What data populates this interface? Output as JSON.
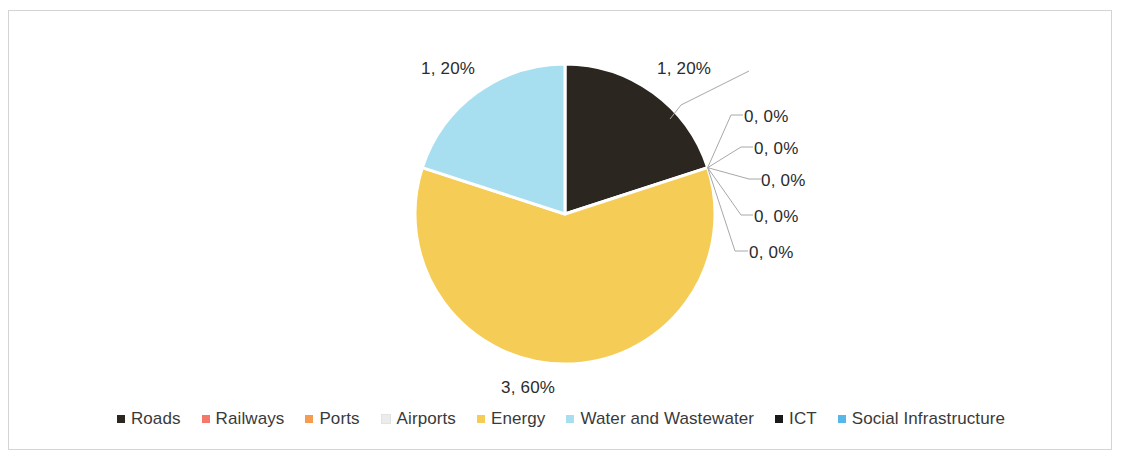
{
  "chart_data": {
    "type": "pie",
    "title": "",
    "legend_position": "bottom",
    "total": 5,
    "categories": [
      "Roads",
      "Railways",
      "Ports",
      "Airports",
      "Energy",
      "Water and Wastewater",
      "ICT",
      "Social Infrastructure"
    ],
    "values": [
      1,
      0,
      0,
      0,
      3,
      1,
      0,
      0
    ],
    "percentages": [
      "20%",
      "0%",
      "0%",
      "0%",
      "60%",
      "20%",
      "0%",
      "0%"
    ],
    "colors": [
      "#2b2620",
      "#f4796b",
      "#f59c4e",
      "#efefef",
      "#f5cd56",
      "#a7dff0",
      "#1a1a1a",
      "#56b7e8"
    ],
    "data_labels": [
      {
        "text": "1, 20%",
        "category": "Roads",
        "leader": true
      },
      {
        "text": "0, 0%",
        "category": "Railways",
        "leader": true
      },
      {
        "text": "0, 0%",
        "category": "Ports",
        "leader": true
      },
      {
        "text": "0, 0%",
        "category": "Airports",
        "leader": true
      },
      {
        "text": "3, 60%",
        "category": "Energy",
        "leader": false
      },
      {
        "text": "1, 20%",
        "category": "Water and Wastewater",
        "leader": false
      },
      {
        "text": "0, 0%",
        "category": "ICT",
        "leader": true
      },
      {
        "text": "0, 0%",
        "category": "Social Infrastructure",
        "leader": true
      }
    ],
    "geometry": {
      "center_x": 556,
      "center_y": 203,
      "radius": 150,
      "start_angle_deg": 0
    },
    "label_positions": [
      {
        "text": "1, 20%",
        "x": 648,
        "y": 48
      },
      {
        "text": "1, 20%",
        "x": 412,
        "y": 48
      },
      {
        "text": "0, 0%",
        "x": 735,
        "y": 96
      },
      {
        "text": "0, 0%",
        "x": 745,
        "y": 128
      },
      {
        "text": "0, 0%",
        "x": 752,
        "y": 160
      },
      {
        "text": "0, 0%",
        "x": 745,
        "y": 196
      },
      {
        "text": "0, 0%",
        "x": 740,
        "y": 232
      },
      {
        "text": "3, 60%",
        "x": 492,
        "y": 367
      }
    ]
  },
  "legend": {
    "items": [
      {
        "label": "Roads",
        "color": "#2b2620"
      },
      {
        "label": "Railways",
        "color": "#f4796b"
      },
      {
        "label": "Ports",
        "color": "#f59c4e"
      },
      {
        "label": "Airports",
        "color": "#ececec"
      },
      {
        "label": "Energy",
        "color": "#f5cd56"
      },
      {
        "label": "Water and Wastewater",
        "color": "#a7dff0"
      },
      {
        "label": "ICT",
        "color": "#1a1a1a"
      },
      {
        "label": "Social Infrastructure",
        "color": "#56b7e8"
      }
    ]
  }
}
